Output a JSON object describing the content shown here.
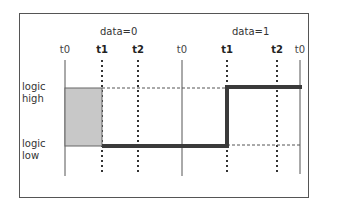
{
  "diagram": {
    "group_labels": [
      {
        "text": "data=0",
        "x": 118
      },
      {
        "text": "data=1",
        "x": 248
      }
    ],
    "ticks": [
      {
        "text": "t0",
        "x": 65,
        "bold": false
      },
      {
        "text": "t1",
        "x": 102,
        "bold": true
      },
      {
        "text": "t2",
        "x": 138,
        "bold": true
      },
      {
        "text": "t0",
        "x": 182,
        "bold": false
      },
      {
        "text": "t1",
        "x": 227,
        "bold": true
      },
      {
        "text": "t2",
        "x": 277,
        "bold": true
      },
      {
        "text": "t0",
        "x": 300,
        "bold": false
      }
    ],
    "y_labels": {
      "high_line1": "logic",
      "high_line2": "high",
      "low_line1": "logic",
      "low_line2": "low"
    },
    "colors": {
      "signal": "#3a3a3a",
      "shaded": "#c8c8c8",
      "grid": "#555555"
    }
  }
}
